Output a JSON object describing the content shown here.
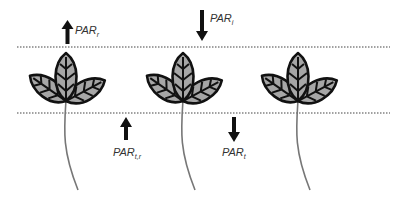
{
  "diagram": {
    "colors": {
      "leaf_fill": "#a6a6a6",
      "leaf_outline": "#111111",
      "stem": "#777777",
      "arrow": "#111111",
      "dotted_line": "#444444",
      "label": "#333333"
    },
    "labels": {
      "par_r": {
        "base": "PAR",
        "sub": "r",
        "arrow": "up",
        "position": "above canopy"
      },
      "par_i": {
        "base": "PAR",
        "sub": "i",
        "arrow": "down",
        "position": "above canopy"
      },
      "par_tr": {
        "base": "PAR",
        "sub": "t,r",
        "arrow": "up",
        "position": "below canopy"
      },
      "par_t": {
        "base": "PAR",
        "sub": "t",
        "arrow": "down",
        "position": "below canopy"
      }
    },
    "boundaries": [
      {
        "name": "top-canopy-boundary",
        "style": "dotted"
      },
      {
        "name": "bottom-canopy-boundary",
        "style": "dotted"
      }
    ],
    "plants": [
      {
        "name": "plant-1",
        "leaves": 3
      },
      {
        "name": "plant-2",
        "leaves": 3
      },
      {
        "name": "plant-3",
        "leaves": 3
      }
    ]
  }
}
